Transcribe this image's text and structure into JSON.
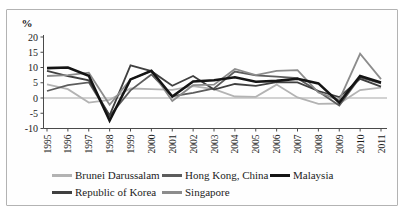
{
  "figure": {
    "background": "#ffffff",
    "border_color": "#b3b3b3"
  },
  "chart_data": {
    "type": "line",
    "title": "",
    "xlabel": "",
    "ylabel": "%",
    "ylim": [
      -10,
      20
    ],
    "yticks": [
      20,
      15,
      10,
      5,
      0,
      -5,
      -10
    ],
    "grid": "zero-line-only",
    "legend_position": "bottom",
    "categories": [
      "1995",
      "1996",
      "1997",
      "1998",
      "1999",
      "2000",
      "2001",
      "2002",
      "2003",
      "2004",
      "2005",
      "2006",
      "2007",
      "2008",
      "2009",
      "2010",
      "2011"
    ],
    "series": [
      {
        "name": "Brunei Darussalam",
        "color": "#b3b3b3",
        "width": 1.8,
        "values": [
          4.5,
          2.9,
          -1.5,
          -0.6,
          3.1,
          2.9,
          2.7,
          3.9,
          2.9,
          0.5,
          0.4,
          4.4,
          0.2,
          -1.9,
          -1.8,
          2.6,
          3.4
        ]
      },
      {
        "name": "Hong Kong, China",
        "color": "#5c5c5c",
        "width": 1.8,
        "values": [
          2.3,
          4.2,
          5.1,
          -5.9,
          2.5,
          7.7,
          0.6,
          1.7,
          3.1,
          8.7,
          7.4,
          7.0,
          6.5,
          2.1,
          -2.5,
          6.8,
          4.8
        ]
      },
      {
        "name": "Malaysia",
        "color": "#141414",
        "width": 2.6,
        "values": [
          9.8,
          10.0,
          7.3,
          -7.4,
          6.1,
          8.9,
          0.5,
          5.4,
          5.8,
          6.8,
          5.3,
          5.6,
          6.3,
          4.8,
          -1.5,
          7.2,
          5.1
        ]
      },
      {
        "name": "Republic of Korea",
        "color": "#404040",
        "width": 1.8,
        "values": [
          8.9,
          7.2,
          5.8,
          -5.7,
          10.7,
          8.8,
          4.0,
          7.2,
          2.8,
          4.6,
          4.0,
          5.2,
          5.1,
          2.3,
          0.3,
          6.3,
          3.7
        ]
      },
      {
        "name": "Singapore",
        "color": "#8c8c8c",
        "width": 1.8,
        "values": [
          7.2,
          7.5,
          8.3,
          -2.2,
          6.1,
          8.9,
          -1.0,
          4.2,
          4.4,
          9.5,
          7.5,
          8.9,
          9.1,
          1.8,
          -0.6,
          14.5,
          6.2
        ]
      }
    ],
    "legend_rows": [
      [
        0,
        1,
        2
      ],
      [
        3,
        4
      ]
    ]
  }
}
